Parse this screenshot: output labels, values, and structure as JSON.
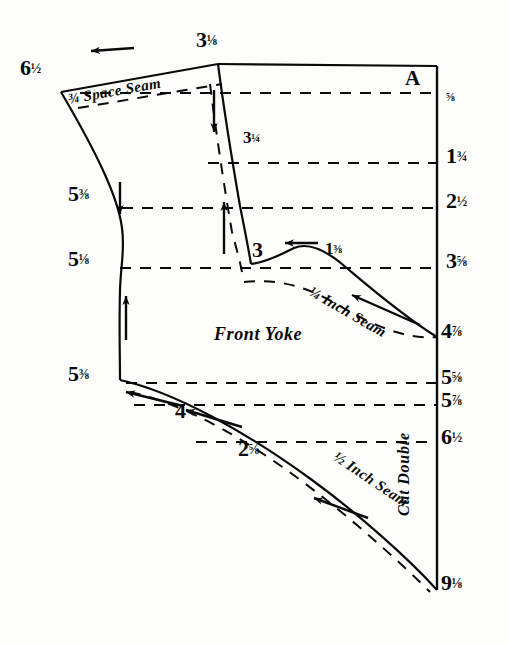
{
  "sheet": {
    "title": "Front Yoke Pattern Draft",
    "width": 509,
    "height": 645,
    "ink_color": "#0a0a0a",
    "paper_color": "#fdfdfb"
  },
  "piece": {
    "name_label": "Front Yoke",
    "corner_label": "A",
    "fold_label": "Cut Double"
  },
  "seams": {
    "space_seam": "¾ Space Seam",
    "quarter_inch_seam": "¼ Inch Seam",
    "half_inch_seam": "½ Inch Seam"
  },
  "left_measurements": [
    {
      "id": "left-top",
      "value": "6½",
      "x": 20,
      "y": 57,
      "whole": "6",
      "fraction": "½"
    },
    {
      "id": "left-upper",
      "value": "5⅜",
      "x": 68,
      "y": 183,
      "whole": "5",
      "fraction": "⅜"
    },
    {
      "id": "left-mid",
      "value": "5⅛",
      "x": 68,
      "y": 248,
      "whole": "5",
      "fraction": "⅛"
    },
    {
      "id": "left-lower",
      "value": "5⅜",
      "x": 68,
      "y": 363,
      "whole": "5",
      "fraction": "⅜"
    }
  ],
  "top_measurements": [
    {
      "id": "top-center",
      "value": "3⅛",
      "x": 196,
      "y": 29,
      "whole": "3",
      "fraction": "⅛"
    }
  ],
  "center_measurements": [
    {
      "id": "center-325",
      "value": "3¼",
      "x": 243,
      "y": 129,
      "whole": "3",
      "fraction": "¼"
    },
    {
      "id": "center-3",
      "value": "3",
      "x": 252,
      "y": 239,
      "whole": "3",
      "fraction": ""
    },
    {
      "id": "center-138",
      "value": "1⅜",
      "x": 325,
      "y": 240,
      "whole": "1",
      "fraction": "⅜"
    }
  ],
  "bottom_measurements": [
    {
      "id": "bottom-4",
      "value": "4",
      "x": 175,
      "y": 400,
      "whole": "4",
      "fraction": ""
    },
    {
      "id": "bottom-258",
      "value": "2⅝",
      "x": 238,
      "y": 438,
      "whole": "2",
      "fraction": "⅝"
    }
  ],
  "right_measurements": [
    {
      "id": "right-058",
      "value": "⅝",
      "x": 446,
      "y": 88,
      "whole": "",
      "fraction": "⅝",
      "line_y": 93
    },
    {
      "id": "right-134",
      "value": "1¾",
      "x": 446,
      "y": 145,
      "whole": "1",
      "fraction": "¾",
      "line_y": 163
    },
    {
      "id": "right-212",
      "value": "2½",
      "x": 446,
      "y": 190,
      "whole": "2",
      "fraction": "½",
      "line_y": 208
    },
    {
      "id": "right-358",
      "value": "3⅝",
      "x": 446,
      "y": 250,
      "whole": "3",
      "fraction": "⅝",
      "line_y": 268
    },
    {
      "id": "right-478",
      "value": "4⅞",
      "x": 441,
      "y": 320,
      "whole": "4",
      "fraction": "⅞",
      "line_y": 337
    },
    {
      "id": "right-558",
      "value": "5⅝",
      "x": 441,
      "y": 366,
      "whole": "5",
      "fraction": "⅝",
      "line_y": 383
    },
    {
      "id": "right-578",
      "value": "5⅞",
      "x": 441,
      "y": 389,
      "whole": "5",
      "fraction": "⅞",
      "line_y": 405
    },
    {
      "id": "right-612",
      "value": "6½",
      "x": 441,
      "y": 426,
      "whole": "6",
      "fraction": "½",
      "line_y": 442
    },
    {
      "id": "right-918",
      "value": "9⅛",
      "x": 441,
      "y": 572,
      "whole": "9",
      "fraction": "⅛",
      "line_y": 590
    }
  ],
  "fraction_glyphs": {
    "one_eighth": "⅛",
    "three_eighths": "⅜",
    "five_eighths": "⅝",
    "seven_eighths": "⅞",
    "one_quarter": "¼",
    "three_quarters": "¾",
    "one_half": "½"
  }
}
